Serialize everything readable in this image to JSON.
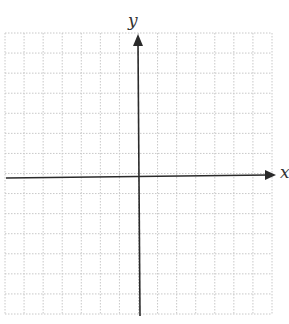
{
  "diagram": {
    "type": "coordinate-plane",
    "axes": {
      "x_label": "x",
      "y_label": "y"
    },
    "grid": {
      "columns": 14,
      "rows": 14,
      "style": "dotted",
      "line_color": "#c8c8c8"
    },
    "colors": {
      "axis": "#2a2a2a",
      "background": "#ffffff"
    }
  }
}
